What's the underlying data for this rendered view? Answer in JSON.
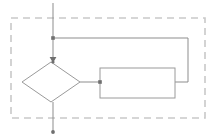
{
  "canvas": {
    "width": 217,
    "height": 140,
    "background": "#ffffff"
  },
  "diagram": {
    "title": "",
    "type": "flowchart",
    "colors": {
      "container_border": "#c9c9c9",
      "shape_stroke": "#9a9a9a",
      "shape_fill": "#ffffff",
      "connector_stroke": "#8d8d8d",
      "junction_fill": "#6f6f6f",
      "arrow_fill": "#6f6f6f"
    },
    "container": {
      "name": "dashed-group-boundary",
      "label": "",
      "x": 11,
      "y": 18,
      "width": 194,
      "height": 100,
      "stroke_dasharray": "7 5",
      "stroke_width": 1.6
    },
    "nodes": [
      {
        "id": "decision",
        "shape": "diamond",
        "label": "",
        "cx": 51,
        "cy": 82,
        "rx": 29,
        "ry": 20
      },
      {
        "id": "process",
        "shape": "rectangle",
        "label": "",
        "x": 100,
        "y": 68,
        "width": 75,
        "height": 30
      }
    ],
    "connectors": [
      {
        "id": "entry-flow",
        "label": "",
        "points": "53,3 53,60",
        "arrowhead": "end-down"
      },
      {
        "id": "decision-to-exit",
        "label": "",
        "points": "53,102 53,131",
        "arrowhead": "end-dot"
      },
      {
        "id": "decision-to-process",
        "label": "",
        "points": "80,82 100,82",
        "arrowhead": "none"
      },
      {
        "id": "feedback-loop",
        "label": "",
        "points": "175,82 188,82 188,38 53,38",
        "arrowhead": "none"
      }
    ],
    "junctions": [
      {
        "id": "branch-top",
        "label": "",
        "cx": 53,
        "cy": 38,
        "r": 1.8
      },
      {
        "id": "branch-process-in",
        "label": "",
        "cx": 100,
        "cy": 82,
        "r": 1.8
      },
      {
        "id": "branch-decision-top",
        "label": "",
        "cx": 53,
        "cy": 62,
        "r": 1.6
      }
    ],
    "terminators": [
      {
        "id": "exit-arrow",
        "label": "",
        "cx": 53,
        "cy": 132,
        "r": 1.9
      }
    ]
  }
}
